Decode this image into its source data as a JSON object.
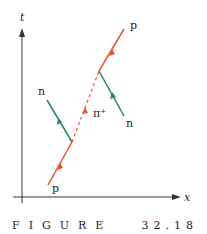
{
  "diagram": {
    "axes": {
      "vertical_label": "t",
      "horizontal_label": "x"
    },
    "particles": [
      {
        "id": "proton-in",
        "label": "p",
        "color": "#e8532a"
      },
      {
        "id": "neutron-left",
        "label": "n",
        "color": "#1f8a5a"
      },
      {
        "id": "pion",
        "label": "π⁺",
        "color": "#e8532a",
        "style": "dashed"
      },
      {
        "id": "proton-out",
        "label": "p",
        "color": "#e8532a"
      },
      {
        "id": "neutron-right",
        "label": "n",
        "color": "#1f8a5a"
      }
    ],
    "colors": {
      "proton": "#e8532a",
      "neutron": "#1f8a5a",
      "axis": "#333333"
    }
  },
  "caption": {
    "word": "FIGURE",
    "number": "32.18"
  }
}
